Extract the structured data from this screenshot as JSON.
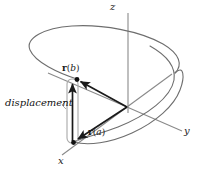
{
  "figure": {
    "axes": {
      "z_label": "z",
      "y_label": "y",
      "x_label": "x"
    },
    "vectors": {
      "r_b": {
        "bold": "r",
        "open": "(",
        "italic": "b",
        "close": ")"
      },
      "r_a": {
        "bold": "r",
        "open": "(",
        "italic": "a",
        "close": ")"
      }
    },
    "annotations": {
      "displacement_label": "displacement"
    },
    "colors": {
      "curve": "#6e6e6e",
      "axis": "#8a8a8a",
      "vector": "#1a1a1a",
      "bracket": "#a8a8a8",
      "text": "#111111",
      "background": "#ffffff"
    }
  }
}
